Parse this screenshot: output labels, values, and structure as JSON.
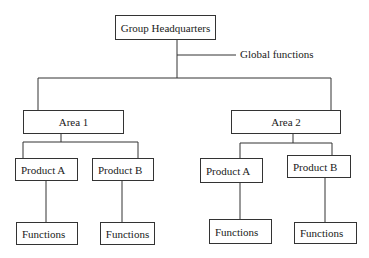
{
  "diagram": {
    "type": "organizational-chart",
    "root": {
      "label": "Group Headquarters",
      "annotation": "Global functions"
    },
    "areas": [
      {
        "label": "Area 1",
        "products": [
          {
            "label": "Product A",
            "functions": "Functions"
          },
          {
            "label": "Product B",
            "functions": "Functions"
          }
        ]
      },
      {
        "label": "Area 2",
        "products": [
          {
            "label": "Product A",
            "functions": "Functions"
          },
          {
            "label": "Product B",
            "functions": "Functions"
          }
        ]
      }
    ],
    "colors": {
      "line": "#333333",
      "box_fill": "#ffffff",
      "text": "#1a1a1a"
    }
  }
}
